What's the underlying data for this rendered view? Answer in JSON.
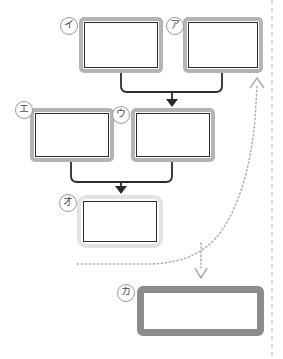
{
  "diagram": {
    "type": "flowchart",
    "background_color": "#ffffff",
    "nodes": [
      {
        "id": "i",
        "label": "イ",
        "style": "shadowed",
        "x": 79,
        "y": 17,
        "w": 84,
        "h": 56,
        "label_x": 60,
        "label_y": 17
      },
      {
        "id": "a",
        "label": "ア",
        "style": "shadowed",
        "x": 183,
        "y": 17,
        "w": 80,
        "h": 56,
        "label_x": 166,
        "label_y": 17
      },
      {
        "id": "e",
        "label": "エ",
        "style": "shadowed",
        "x": 30,
        "y": 108,
        "w": 84,
        "h": 54,
        "label_x": 15,
        "label_y": 101
      },
      {
        "id": "u",
        "label": "ウ",
        "style": "shadowed",
        "x": 131,
        "y": 108,
        "w": 84,
        "h": 54,
        "label_x": 112,
        "label_y": 106
      },
      {
        "id": "o",
        "label": "オ",
        "style": "light",
        "x": 77,
        "y": 195,
        "w": 86,
        "h": 53,
        "label_x": 59,
        "label_y": 194
      },
      {
        "id": "ka",
        "label": "カ",
        "style": "thick",
        "x": 137,
        "y": 286,
        "w": 127,
        "h": 50,
        "label_x": 117,
        "label_y": 284
      }
    ],
    "connectors": [
      {
        "id": "i-to-u",
        "kind": "solid",
        "from": "イ",
        "to": "ウ",
        "arrow": "down"
      },
      {
        "id": "a-to-u",
        "kind": "solid",
        "from": "ア",
        "to": "ウ",
        "arrow": "down"
      },
      {
        "id": "e-to-o",
        "kind": "solid",
        "from": "エ",
        "to": "オ",
        "arrow": "down"
      },
      {
        "id": "u-to-o",
        "kind": "solid",
        "from": "ウ",
        "to": "オ",
        "arrow": "down"
      },
      {
        "id": "o-to-up",
        "kind": "dotted",
        "from": "オ",
        "to": "上方向",
        "arrow": "up"
      },
      {
        "id": "o-to-ka",
        "kind": "dotted",
        "from": "オ",
        "to": "カ",
        "arrow": "down"
      }
    ],
    "boundary": {
      "id": "right-boundary",
      "kind": "dashed-vertical",
      "x": 272
    },
    "colors": {
      "line": "#2b2b2b",
      "dotted_line": "#b0b0b0",
      "boundary_line": "#c8c8c8",
      "frame_grey": "#b4b4b4",
      "frame_light": "#e2e2e2",
      "frame_thick": "#8c8c8c",
      "label_text": "#4a4a4a"
    }
  }
}
